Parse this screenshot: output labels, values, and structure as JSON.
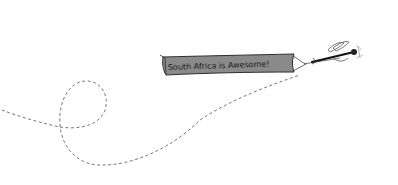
{
  "illustration": {
    "banner": {
      "text": "South Africa is Awesome!",
      "fill_color": "#8a8a8a",
      "outline_color": "#333333"
    },
    "plane": {
      "icon": "plane-icon"
    },
    "trail": {
      "style": "dashed",
      "color": "#777777"
    },
    "background_color": "#ffffff"
  }
}
